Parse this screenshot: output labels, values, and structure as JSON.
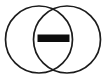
{
  "figure": {
    "background_color": "#ffffff",
    "width": 106,
    "height": 81
  },
  "chart_data": {
    "type": "diagram",
    "subtype": "venn",
    "title": "",
    "background": "#ffffff",
    "sets": [
      {
        "name": "left-set",
        "label": "",
        "cx": 39,
        "cy": 39.5,
        "r": 33.5,
        "stroke": "#1c1c1c",
        "stroke_width": 1.7,
        "fill": "none"
      },
      {
        "name": "right-set",
        "label": "",
        "cx": 67,
        "cy": 39.5,
        "r": 33.5,
        "stroke": "#1c1c1c",
        "stroke_width": 1.7,
        "fill": "none"
      }
    ],
    "annotations": [
      {
        "name": "intersection-bar",
        "shape": "rect",
        "x": 37.5,
        "y": 34.5,
        "width": 32,
        "height": 7.5,
        "fill": "#0d0d0d",
        "label": ""
      }
    ],
    "intersection_points": [
      {
        "x": 53,
        "y": 8
      },
      {
        "x": 53,
        "y": 71
      }
    ],
    "grid": false,
    "legend": null
  },
  "elements": {
    "left_circle_name": "left-circle",
    "right_circle_name": "right-circle",
    "bar_name": "intersection-minus-bar"
  }
}
